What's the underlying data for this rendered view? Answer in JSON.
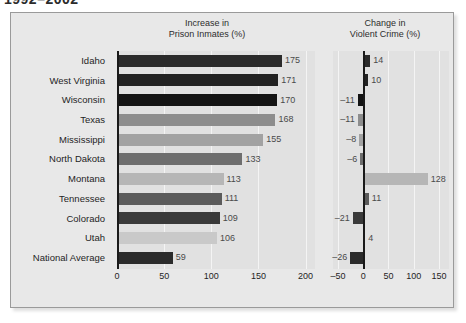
{
  "title": "1992–2002",
  "panel": {
    "background_color": "#e8e8e8",
    "plot_background_color": "#e1e1e1",
    "border_color": "#9a9a9a"
  },
  "header_left": "Increase in\nPrison Inmates (%)",
  "header_right": "Change in\nViolent Crime (%)",
  "chart_data": [
    {
      "type": "bar",
      "orientation": "horizontal",
      "title": "Increase in\nPrison Inmates (%)",
      "xlabel": "",
      "ylabel": "",
      "xlim": [
        0,
        210
      ],
      "ticks": [
        0,
        50,
        100,
        150,
        200
      ],
      "tick_labels": [
        "0",
        "50",
        "100",
        "150",
        "200"
      ],
      "grid": true,
      "legend": "none",
      "categories": [
        "Idaho",
        "West Virginia",
        "Wisconsin",
        "Texas",
        "Mississippi",
        "North Dakota",
        "Montana",
        "Tennessee",
        "Colorado",
        "Utah",
        "National Average"
      ],
      "values": [
        175,
        171,
        170,
        168,
        155,
        133,
        113,
        111,
        109,
        106,
        59
      ],
      "value_labels": [
        "175",
        "171",
        "170",
        "168",
        "155",
        "133",
        "113",
        "111",
        "109",
        "106",
        "59"
      ],
      "bar_colors": [
        "#2b2b2b",
        "#222222",
        "#141414",
        "#8d8d8d",
        "#a2a2a2",
        "#6e6e6e",
        "#b6b6b6",
        "#5b5b5b",
        "#3a3a3a",
        "#c9c9c9",
        "#2b2b2b"
      ]
    },
    {
      "type": "bar",
      "orientation": "horizontal",
      "title": "Change in\nViolent Crime (%)",
      "xlabel": "",
      "ylabel": "",
      "xlim": [
        -60,
        170
      ],
      "ticks": [
        -50,
        0,
        50,
        100,
        150
      ],
      "tick_labels": [
        "–50",
        "0",
        "50",
        "100",
        "150"
      ],
      "grid": true,
      "legend": "none",
      "categories": [
        "Idaho",
        "West Virginia",
        "Wisconsin",
        "Texas",
        "Mississippi",
        "North Dakota",
        "Montana",
        "Tennessee",
        "Colorado",
        "Utah",
        "National Average"
      ],
      "values": [
        14,
        10,
        -11,
        -11,
        -8,
        -6,
        128,
        11,
        -21,
        4,
        -26
      ],
      "value_labels": [
        "14",
        "10",
        "–11",
        "–11",
        "–8",
        "–6",
        "128",
        "11",
        "–21",
        "4",
        "–26"
      ],
      "bar_colors": [
        "#2b2b2b",
        "#222222",
        "#141414",
        "#8d8d8d",
        "#a2a2a2",
        "#6e6e6e",
        "#b6b6b6",
        "#5b5b5b",
        "#3a3a3a",
        "#c9c9c9",
        "#2b2b2b"
      ]
    }
  ]
}
